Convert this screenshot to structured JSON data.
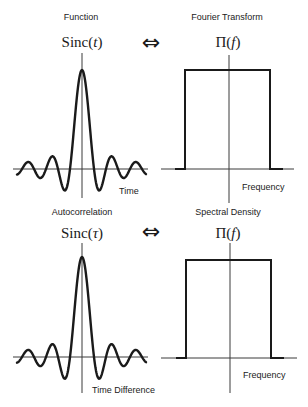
{
  "top": {
    "left": {
      "caption": "Function",
      "symbol": "Sinc",
      "arg": "t",
      "axis_label": "Time"
    },
    "arrow": "⇔",
    "right": {
      "caption": "Fourier Transform",
      "symbol": "Π",
      "arg": "f",
      "axis_label": "Frequency"
    }
  },
  "bottom": {
    "left": {
      "caption": "Autocorrelation",
      "symbol": "Sinc",
      "arg": "τ",
      "axis_label": "Time Difference"
    },
    "arrow": "⇔",
    "right": {
      "caption": "Spectral Density",
      "symbol": "Π",
      "arg": "f",
      "axis_label": "Frequency"
    }
  },
  "chart_data": [
    {
      "type": "line",
      "title": "Function: Sinc(t)",
      "xlabel": "Time",
      "function": "sinc",
      "panel": {
        "origin": [
          82,
          169
        ],
        "h_axis": [
          13,
          148
        ],
        "v_axis": [
          53,
          198
        ],
        "amplitude_px": 99,
        "zero_spacing_px": 12,
        "x_extent_px": [
          -65,
          64
        ]
      }
    },
    {
      "type": "line",
      "title": "Fourier Transform: Π(f)",
      "xlabel": "Frequency",
      "function": "rect",
      "panel": {
        "origin": [
          229,
          169
        ],
        "h_axis": [
          161,
          294
        ],
        "v_axis": [
          55,
          203
        ],
        "rect_x": [
          185,
          270
        ],
        "rect_top": 70,
        "baseline_stubs": [
          [
            175,
            185
          ],
          [
            270,
            283
          ]
        ]
      }
    },
    {
      "type": "line",
      "title": "Autocorrelation: Sinc(τ)",
      "xlabel": "Time Difference",
      "function": "sinc",
      "panel": {
        "origin": [
          82,
          357
        ],
        "h_axis": [
          13,
          148
        ],
        "v_axis": [
          243,
          393
        ],
        "amplitude_px": 100,
        "zero_spacing_px": 12,
        "x_extent_px": [
          -65,
          64
        ]
      }
    },
    {
      "type": "line",
      "title": "Spectral Density: Π(f)",
      "xlabel": "Frequency",
      "function": "rect",
      "panel": {
        "origin": [
          230,
          358
        ],
        "h_axis": [
          161,
          297
        ],
        "v_axis": [
          243,
          393
        ],
        "rect_x": [
          186,
          271
        ],
        "rect_top": 260,
        "baseline_stubs": [
          [
            176,
            186
          ],
          [
            271,
            284
          ]
        ]
      }
    }
  ]
}
